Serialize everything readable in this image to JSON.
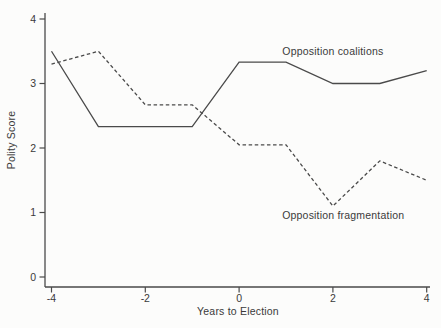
{
  "figure": {
    "background_color": "#fcfcfb",
    "line_color": "#4a4a4a",
    "text_color": "#3a3a3a"
  },
  "chart_data": {
    "type": "line",
    "x": [
      -4,
      -3,
      -2,
      -1,
      0,
      1,
      2,
      3,
      4
    ],
    "series": [
      {
        "name": "Opposition coalitions",
        "style": "solid",
        "values": [
          3.5,
          2.33,
          2.33,
          2.33,
          3.33,
          3.33,
          3.0,
          3.0,
          3.2
        ]
      },
      {
        "name": "Opposition fragmentation",
        "style": "dashed",
        "values": [
          3.3,
          3.5,
          2.67,
          2.67,
          2.05,
          2.05,
          1.1,
          1.8,
          1.5
        ]
      }
    ],
    "title": "",
    "xlabel": "Years to Election",
    "ylabel": "Polity Score",
    "xlim": [
      -4,
      4
    ],
    "ylim": [
      0,
      4
    ],
    "x_ticks": [
      -4,
      -2,
      0,
      2,
      4
    ],
    "x_tick_labels": [
      "-4",
      "-2",
      "0",
      "2",
      "4"
    ],
    "y_ticks": [
      0,
      1,
      2,
      3,
      4
    ],
    "y_tick_labels": [
      "0",
      "1",
      "2",
      "3",
      "4"
    ],
    "grid": false,
    "legend_position": "inline-annotations",
    "annotations": [
      {
        "text": "Opposition coalitions",
        "x": 2.0,
        "y": 3.5
      },
      {
        "text": "Opposition fragmentation",
        "x": 2.22,
        "y": 0.96
      }
    ]
  }
}
